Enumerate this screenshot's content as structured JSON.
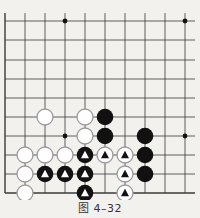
{
  "figure": {
    "caption": "图 4–32",
    "colors": {
      "background": "#f3f1ee",
      "grid_line": "#3a3a3a",
      "black_stone": "#111111",
      "white_stone_fill": "#ffffff",
      "white_stone_outline": "#9a9a9a",
      "star_point": "#111111"
    }
  },
  "board": {
    "columns_x": [
      5,
      25,
      45,
      65,
      85,
      105,
      125,
      145,
      165,
      185
    ],
    "rows_y": [
      21,
      40,
      60,
      79,
      98,
      117,
      136,
      155,
      174,
      193
    ],
    "right_edge_x": 195,
    "top_edge_y": 13,
    "edges": {
      "left": true,
      "bottom": true,
      "top": false,
      "right": false
    },
    "star_points": [
      {
        "col": 3,
        "row": 0
      },
      {
        "col": 9,
        "row": 0
      },
      {
        "col": 3,
        "row": 6
      },
      {
        "col": 9,
        "row": 6
      }
    ],
    "stones": [
      {
        "col": 2,
        "row": 5,
        "color": "white",
        "marker": null
      },
      {
        "col": 4,
        "row": 5,
        "color": "white",
        "marker": null
      },
      {
        "col": 5,
        "row": 5,
        "color": "black",
        "marker": null
      },
      {
        "col": 4,
        "row": 6,
        "color": "white",
        "marker": null
      },
      {
        "col": 5,
        "row": 6,
        "color": "black",
        "marker": null
      },
      {
        "col": 7,
        "row": 6,
        "color": "black",
        "marker": null
      },
      {
        "col": 1,
        "row": 7,
        "color": "white",
        "marker": null
      },
      {
        "col": 2,
        "row": 7,
        "color": "white",
        "marker": null
      },
      {
        "col": 3,
        "row": 7,
        "color": "white",
        "marker": null
      },
      {
        "col": 4,
        "row": 7,
        "color": "black",
        "marker": "triangle"
      },
      {
        "col": 5,
        "row": 7,
        "color": "white",
        "marker": "triangle"
      },
      {
        "col": 6,
        "row": 7,
        "color": "white",
        "marker": "triangle"
      },
      {
        "col": 7,
        "row": 7,
        "color": "black",
        "marker": null
      },
      {
        "col": 1,
        "row": 8,
        "color": "white",
        "marker": null
      },
      {
        "col": 2,
        "row": 8,
        "color": "black",
        "marker": "triangle"
      },
      {
        "col": 3,
        "row": 8,
        "color": "black",
        "marker": "triangle"
      },
      {
        "col": 4,
        "row": 8,
        "color": "black",
        "marker": "triangle"
      },
      {
        "col": 6,
        "row": 8,
        "color": "white",
        "marker": "triangle"
      },
      {
        "col": 7,
        "row": 8,
        "color": "black",
        "marker": null
      },
      {
        "col": 1,
        "row": 9,
        "color": "white",
        "marker": null
      },
      {
        "col": 4,
        "row": 9,
        "color": "black",
        "marker": "triangle"
      },
      {
        "col": 6,
        "row": 9,
        "color": "white",
        "marker": "triangle"
      }
    ]
  }
}
